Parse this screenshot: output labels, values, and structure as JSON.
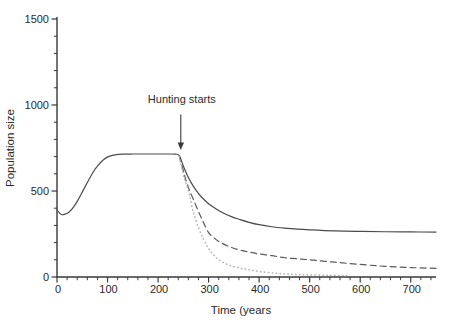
{
  "figure": {
    "background": "#ffffff"
  },
  "chart_data": {
    "type": "line",
    "title": "",
    "xlabel": "Time (years",
    "ylabel": "Population size",
    "xlim": [
      0,
      750
    ],
    "ylim": [
      0,
      1500
    ],
    "x_major_ticks": [
      0,
      100,
      200,
      300,
      400,
      500,
      600,
      700
    ],
    "x_minor_step": 20,
    "y_major_ticks": [
      0,
      500,
      1000,
      1500
    ],
    "y_minor_step": 100,
    "grid": false,
    "legend": "none",
    "axis_color": "#3a3a3a",
    "text_color": "#2a2a2a",
    "annotation": {
      "text": "Hunting starts",
      "x": 245,
      "y_text": 1012,
      "y_from": 945,
      "y_to": 738
    },
    "series": [
      {
        "name": "solid-line",
        "style": "solid",
        "color": "#4b4b4b",
        "points": [
          [
            0,
            390
          ],
          [
            5,
            372
          ],
          [
            10,
            362
          ],
          [
            16,
            366
          ],
          [
            24,
            378
          ],
          [
            33,
            408
          ],
          [
            42,
            450
          ],
          [
            52,
            505
          ],
          [
            62,
            560
          ],
          [
            72,
            612
          ],
          [
            82,
            652
          ],
          [
            92,
            682
          ],
          [
            102,
            700
          ],
          [
            115,
            710
          ],
          [
            130,
            714
          ],
          [
            150,
            715
          ],
          [
            175,
            715
          ],
          [
            200,
            715
          ],
          [
            220,
            715
          ],
          [
            235,
            714
          ],
          [
            242,
            706
          ],
          [
            250,
            645
          ],
          [
            258,
            590
          ],
          [
            266,
            546
          ],
          [
            275,
            505
          ],
          [
            285,
            468
          ],
          [
            300,
            426
          ],
          [
            315,
            396
          ],
          [
            330,
            371
          ],
          [
            345,
            351
          ],
          [
            360,
            336
          ],
          [
            380,
            318
          ],
          [
            400,
            304
          ],
          [
            425,
            292
          ],
          [
            450,
            284
          ],
          [
            475,
            278
          ],
          [
            500,
            274
          ],
          [
            550,
            268
          ],
          [
            600,
            265
          ],
          [
            650,
            263
          ],
          [
            700,
            262
          ],
          [
            750,
            261
          ]
        ]
      },
      {
        "name": "dashed-line",
        "style": "dashed",
        "color": "#5a5a5a",
        "points": [
          [
            242,
            704
          ],
          [
            250,
            618
          ],
          [
            256,
            555
          ],
          [
            262,
            505
          ],
          [
            270,
            450
          ],
          [
            280,
            380
          ],
          [
            290,
            316
          ],
          [
            300,
            258
          ],
          [
            310,
            230
          ],
          [
            320,
            207
          ],
          [
            340,
            178
          ],
          [
            360,
            158
          ],
          [
            380,
            145
          ],
          [
            400,
            134
          ],
          [
            425,
            124
          ],
          [
            450,
            112
          ],
          [
            475,
            106
          ],
          [
            500,
            100
          ],
          [
            550,
            86
          ],
          [
            600,
            73
          ],
          [
            650,
            62
          ],
          [
            700,
            55
          ],
          [
            750,
            50
          ]
        ]
      },
      {
        "name": "dotted-line",
        "style": "dotted",
        "color": "#b2b2b2",
        "points": [
          [
            242,
            700
          ],
          [
            250,
            595
          ],
          [
            256,
            540
          ],
          [
            262,
            480
          ],
          [
            270,
            375
          ],
          [
            280,
            288
          ],
          [
            290,
            218
          ],
          [
            300,
            165
          ],
          [
            310,
            128
          ],
          [
            320,
            100
          ],
          [
            335,
            76
          ],
          [
            350,
            60
          ],
          [
            365,
            50
          ],
          [
            380,
            42
          ],
          [
            400,
            32
          ],
          [
            425,
            24
          ],
          [
            450,
            18
          ],
          [
            475,
            15
          ],
          [
            500,
            12
          ],
          [
            540,
            10
          ],
          [
            580,
            8
          ]
        ]
      }
    ]
  }
}
